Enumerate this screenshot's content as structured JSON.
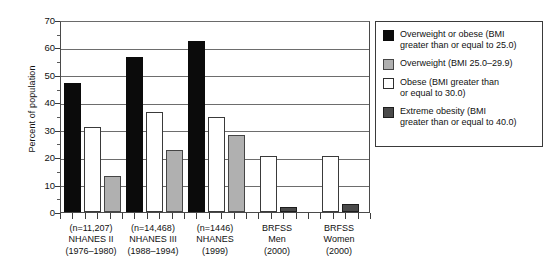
{
  "chart_data": {
    "type": "bar",
    "title": "",
    "xlabel": "",
    "ylabel": "Percent of population",
    "ylim": [
      0,
      70
    ],
    "ytick_values": [
      0,
      10,
      20,
      30,
      40,
      50,
      60,
      70
    ],
    "ytick_labels": [
      "0",
      "10",
      "20",
      "30",
      "40",
      "50",
      "60",
      "70"
    ],
    "grid": true,
    "legend_position": "right-outside",
    "categories": [
      "(n=11,207) NHANES II (1976-1980)",
      "(n=14,468) NHANES III (1988-1994)",
      "(n=1446) NHANES (1999)",
      "BRFSS Men (2000)",
      "BRFSS Women (2000)"
    ],
    "category_lines": [
      [
        "(n=11,207)",
        "NHANES II",
        "(1976–1980)"
      ],
      [
        "(n=14,468)",
        "NHANES III",
        "(1988–1994)"
      ],
      [
        "(n=1446)",
        "NHANES",
        "(1999)"
      ],
      [
        "BRFSS",
        "Men",
        "(2000)"
      ],
      [
        "BRFSS",
        "Women",
        "(2000)"
      ]
    ],
    "series": [
      {
        "name": "Overweight or obese (BMI greater than or equal to 25.0)",
        "short_name": "Overweight or obese",
        "color": "#0b0b0b",
        "values": [
          47.0,
          56.5,
          62.5,
          null,
          null
        ]
      },
      {
        "name": "Obese (BMI greater than or equal to 30.0)",
        "short_name": "Obese",
        "color": "#ffffff",
        "values": [
          31.0,
          36.5,
          34.5,
          20.5,
          20.5
        ]
      },
      {
        "name": "Overweight (BMI 25.0–29.9)",
        "short_name": "Overweight",
        "color": "#b0b0b0",
        "values": [
          13.0,
          22.5,
          28.0,
          null,
          null
        ]
      },
      {
        "name": "Extreme obesity (BMI greater than or equal to 40.0)",
        "short_name": "Extreme obesity",
        "color": "#4a4a4a",
        "values": [
          null,
          null,
          null,
          2.0,
          3.0
        ]
      }
    ]
  },
  "legend": {
    "items": [
      {
        "swatch": "black",
        "line1": "Overweight or obese (BMI",
        "line2": "greater than or equal to 25.0)"
      },
      {
        "swatch": "gray",
        "line1": "Overweight (BMI 25.0–29.9)",
        "line2": ""
      },
      {
        "swatch": "white",
        "line1": "Obese (BMI greater than",
        "line2": "or equal to 30.0)"
      },
      {
        "swatch": "dark",
        "line1": "Extreme obesity (BMI",
        "line2": "greater than or equal to 40.0)"
      }
    ]
  }
}
